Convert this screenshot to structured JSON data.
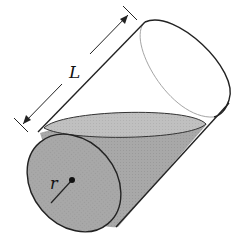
{
  "diagram": {
    "labels": {
      "length": "L",
      "radius": "r"
    },
    "colors": {
      "stroke": "#222222",
      "hidden_edge": "#9a9a9a",
      "liquid_face": "#a9a9a9",
      "liquid_body": "#9c9c9c",
      "liquid_surface": "#bdbdbd",
      "background": "#ffffff"
    }
  }
}
